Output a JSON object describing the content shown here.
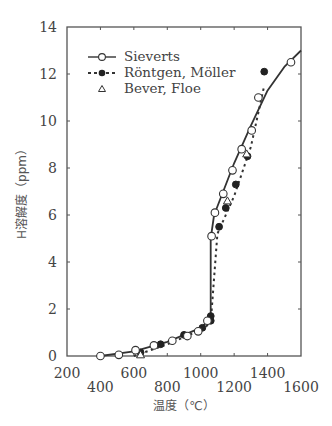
{
  "chart_data": {
    "type": "line",
    "title": "",
    "xlabel": "温度（℃）",
    "ylabel": "H溶解度（ppm）",
    "xlim": [
      200,
      1600
    ],
    "ylim": [
      0,
      14
    ],
    "x_ticks": [
      200,
      400,
      600,
      800,
      1000,
      1200,
      1400,
      1600
    ],
    "y_ticks": [
      0,
      2,
      4,
      6,
      8,
      10,
      12,
      14
    ],
    "grid": false,
    "legend_position": "upper-left",
    "series": [
      {
        "name": "Sieverts",
        "style": "solid-line-open-circle",
        "points": [
          [
            400,
            0.0
          ],
          [
            510,
            0.05
          ],
          [
            610,
            0.25
          ],
          [
            720,
            0.45
          ],
          [
            830,
            0.65
          ],
          [
            920,
            0.85
          ],
          [
            985,
            1.05
          ],
          [
            1040,
            1.5
          ],
          [
            1065,
            5.1
          ],
          [
            1085,
            6.1
          ],
          [
            1135,
            6.9
          ],
          [
            1190,
            7.9
          ],
          [
            1245,
            8.8
          ],
          [
            1305,
            9.6
          ],
          [
            1345,
            11.0
          ],
          [
            1540,
            12.5
          ]
        ],
        "curve": [
          [
            400,
            0.0
          ],
          [
            600,
            0.2
          ],
          [
            800,
            0.6
          ],
          [
            1000,
            1.2
          ],
          [
            1060,
            1.6
          ],
          [
            1060,
            5.0
          ],
          [
            1080,
            6.0
          ],
          [
            1200,
            8.2
          ],
          [
            1300,
            9.8
          ],
          [
            1400,
            11.3
          ],
          [
            1500,
            12.3
          ],
          [
            1600,
            13.0
          ]
        ]
      },
      {
        "name": "Röntgen, Möller",
        "style": "dashed-line-filled-circle",
        "points": [
          [
            640,
            0.15
          ],
          [
            760,
            0.5
          ],
          [
            900,
            0.9
          ],
          [
            1010,
            1.2
          ],
          [
            1060,
            1.5
          ],
          [
            1060,
            1.7
          ],
          [
            1110,
            5.5
          ],
          [
            1150,
            6.3
          ],
          [
            1210,
            7.3
          ],
          [
            1280,
            8.5
          ],
          [
            1380,
            12.1
          ]
        ],
        "curve": [
          [
            600,
            0.0
          ],
          [
            800,
            0.5
          ],
          [
            1000,
            1.1
          ],
          [
            1060,
            1.4
          ],
          [
            1100,
            5.2
          ],
          [
            1200,
            6.8
          ],
          [
            1300,
            8.9
          ],
          [
            1380,
            11.5
          ]
        ]
      },
      {
        "name": "Bever, Floe",
        "style": "open-triangle",
        "points": [
          [
            640,
            0.05
          ],
          [
            1160,
            6.6
          ],
          [
            1275,
            8.6
          ]
        ]
      }
    ]
  },
  "legend": {
    "items": [
      {
        "label": "Sieverts"
      },
      {
        "label": "Röntgen,  Möller"
      },
      {
        "label": "Bever,  Floe"
      }
    ]
  },
  "axes": {
    "x_labels_upper": [
      "200",
      "600",
      "1000",
      "1400"
    ],
    "x_labels_lower": [
      "400",
      "800",
      "1200",
      "1600"
    ],
    "y_labels": [
      "0",
      "2",
      "4",
      "6",
      "8",
      "10",
      "12",
      "14"
    ],
    "x_title": "温度（℃）",
    "y_title": "H溶解度（ppm）"
  }
}
